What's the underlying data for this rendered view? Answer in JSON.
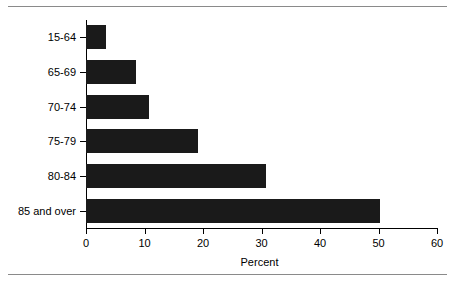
{
  "chart_data": {
    "type": "bar",
    "orientation": "horizontal",
    "title": "",
    "subtitle": "",
    "xlabel": "Percent",
    "ylabel": "",
    "categories": [
      "15-64",
      "65-69",
      "70-74",
      "75-79",
      "80-84",
      "85 and over"
    ],
    "values": [
      3.4,
      8.6,
      10.8,
      19.2,
      30.8,
      50.2
    ],
    "series": [
      {
        "name": "Percent",
        "values": [
          3.4,
          8.6,
          10.8,
          19.2,
          30.8,
          50.2
        ]
      }
    ],
    "xlim": [
      0,
      60
    ],
    "xticks": [
      0,
      10,
      20,
      30,
      40,
      50,
      60
    ],
    "xtick_labels": [
      "0",
      "10",
      "20",
      "30",
      "40",
      "50",
      "60"
    ],
    "grid": false,
    "legend": null,
    "legend_position": "none",
    "bar_color": "#1a1a1a",
    "background_color": "#ffffff",
    "axis_color": "#000000",
    "rule_color": "#8a8a8a",
    "annotations": []
  },
  "figure": {
    "top_rule": "",
    "bottom_rule": ""
  }
}
